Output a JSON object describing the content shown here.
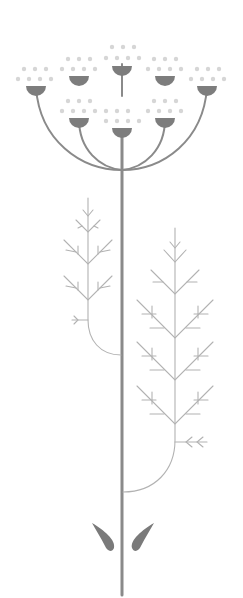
{
  "illustration": {
    "title": "Stylized umbellifer plant illustration",
    "colors": {
      "background": "#ffffff",
      "stem": "#8a8a8a",
      "fern": "#b2b2b2",
      "flower_cup": "#7d7d7d",
      "dots": "#d6d6d6",
      "leaves": "#7a7a7a"
    },
    "flower_heads_count": 9,
    "fern_branches_count": 2,
    "leaves_count": 2
  }
}
